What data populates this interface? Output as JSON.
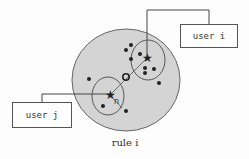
{
  "diagram": {
    "caption": "rule i",
    "boxes": [
      {
        "id": "user_i",
        "label": "user i"
      },
      {
        "id": "user_j",
        "label": "user j"
      }
    ],
    "radius_label": "n",
    "colors": {
      "region_fill": "#d4d4d4",
      "stroke": "#444444",
      "point": "#222222"
    }
  }
}
